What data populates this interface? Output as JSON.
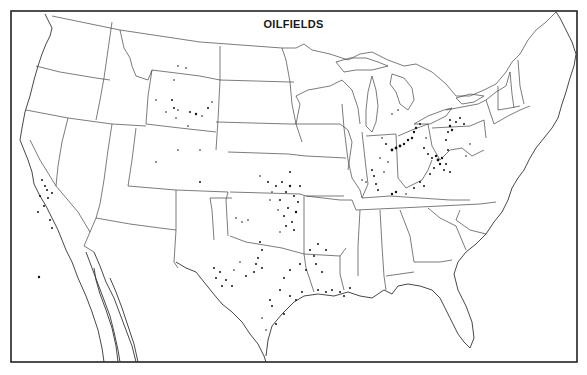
{
  "map": {
    "title": "OILFIELDS",
    "region": "Continental United States",
    "style": "black-and-white outline map with state boundaries",
    "colors": {
      "background": "#ffffff",
      "lines": "#333333",
      "oilfield_dots": "#111111"
    },
    "oilfield_regions": [
      {
        "name": "California",
        "density": "moderate"
      },
      {
        "name": "Wyoming",
        "density": "scattered"
      },
      {
        "name": "Montana",
        "density": "sparse"
      },
      {
        "name": "Colorado",
        "density": "sparse"
      },
      {
        "name": "Kansas",
        "density": "dense"
      },
      {
        "name": "Oklahoma",
        "density": "dense"
      },
      {
        "name": "Texas",
        "density": "dense"
      },
      {
        "name": "Louisiana Gulf Coast",
        "density": "moderate"
      },
      {
        "name": "Arkansas",
        "density": "sparse"
      },
      {
        "name": "Illinois",
        "density": "moderate"
      },
      {
        "name": "Indiana",
        "density": "moderate"
      },
      {
        "name": "Ohio",
        "density": "dense"
      },
      {
        "name": "Kentucky",
        "density": "moderate"
      },
      {
        "name": "West Virginia",
        "density": "dense"
      },
      {
        "name": "Pennsylvania",
        "density": "dense"
      },
      {
        "name": "New York",
        "density": "sparse"
      },
      {
        "name": "Michigan",
        "density": "sparse"
      }
    ]
  }
}
